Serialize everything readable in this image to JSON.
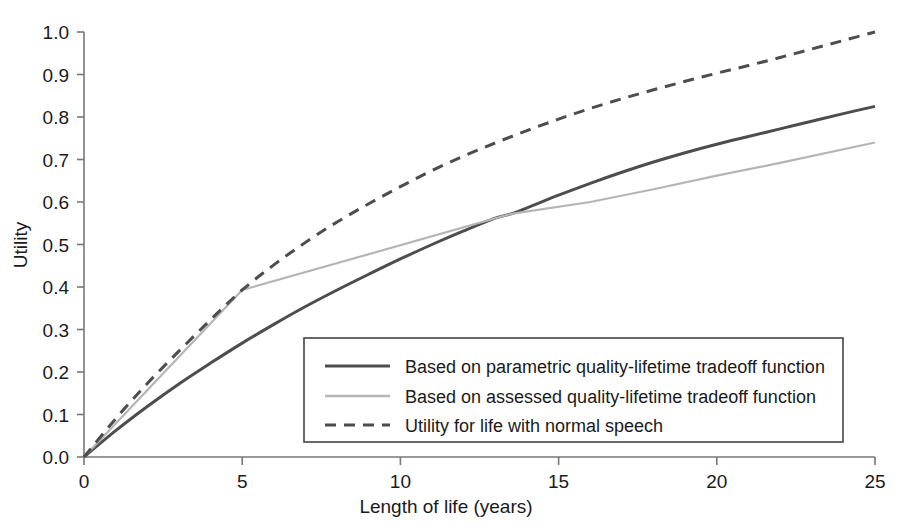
{
  "chart_data": {
    "type": "line",
    "title": "",
    "xlabel": "Length of life (years)",
    "ylabel": "Utility",
    "xlim": [
      0,
      25
    ],
    "ylim": [
      0.0,
      1.0
    ],
    "xticks": [
      "0",
      "5",
      "10",
      "15",
      "20",
      "25"
    ],
    "xtick_values": [
      0,
      5,
      10,
      15,
      20,
      25
    ],
    "yticks": [
      "0.0",
      "0.1",
      "0.2",
      "0.3",
      "0.4",
      "0.5",
      "0.6",
      "0.7",
      "0.8",
      "0.9",
      "1.0"
    ],
    "ytick_values": [
      0.0,
      0.1,
      0.2,
      0.3,
      0.4,
      0.5,
      0.6,
      0.7,
      0.8,
      0.9,
      1.0
    ],
    "grid": false,
    "legend_position": "lower-right-inside",
    "series": [
      {
        "name": "Based on parametric quality-lifetime tradeoff function",
        "style": "solid",
        "color": "#4d4d4d",
        "width": 3.0,
        "x": [
          0,
          1,
          2,
          3,
          4,
          5,
          6,
          7,
          8,
          9,
          10,
          11,
          12,
          13,
          13.5,
          14,
          15,
          16,
          17,
          18,
          19,
          20,
          21,
          22,
          23,
          24,
          25
        ],
        "y": [
          0.0,
          0.062,
          0.119,
          0.172,
          0.221,
          0.268,
          0.312,
          0.354,
          0.393,
          0.43,
          0.466,
          0.5,
          0.532,
          0.562,
          0.572,
          0.586,
          0.616,
          0.644,
          0.67,
          0.694,
          0.716,
          0.736,
          0.754,
          0.772,
          0.79,
          0.808,
          0.825
        ]
      },
      {
        "name": "Based on assessed quality-lifetime tradeoff function",
        "style": "solid",
        "color": "#b5b5b5",
        "width": 2.2,
        "x": [
          0,
          5,
          13.5,
          16,
          18,
          20,
          22,
          25
        ],
        "y": [
          0.0,
          0.393,
          0.572,
          0.6,
          0.63,
          0.662,
          0.692,
          0.74
        ]
      },
      {
        "name": "Utility for life with normal speech",
        "style": "dashed",
        "color": "#4d4d4d",
        "width": 3.0,
        "x": [
          0,
          1,
          2,
          3,
          4,
          5,
          6,
          7,
          8,
          9,
          10,
          11,
          12,
          13,
          14,
          15,
          16,
          17,
          18,
          19,
          20,
          21,
          22,
          23,
          24,
          25
        ],
        "y": [
          0.0,
          0.09,
          0.173,
          0.249,
          0.323,
          0.393,
          0.452,
          0.505,
          0.553,
          0.596,
          0.636,
          0.674,
          0.708,
          0.739,
          0.768,
          0.795,
          0.82,
          0.843,
          0.864,
          0.884,
          0.903,
          0.921,
          0.94,
          0.96,
          0.98,
          1.0
        ]
      }
    ]
  },
  "legend": {
    "entries": [
      {
        "label": "Based on parametric quality-lifetime tradeoff function",
        "swatch": "solid-dark-line-icon"
      },
      {
        "label": "Based on assessed quality-lifetime tradeoff function",
        "swatch": "solid-light-line-icon"
      },
      {
        "label": "Utility for life with normal speech",
        "swatch": "dashed-line-icon"
      }
    ]
  },
  "colors": {
    "parametric": "#4d4d4d",
    "assessed": "#b5b5b5",
    "normal_speech": "#4d4d4d",
    "axis": "#777777",
    "text": "#1a1a1a",
    "background": "#ffffff"
  }
}
